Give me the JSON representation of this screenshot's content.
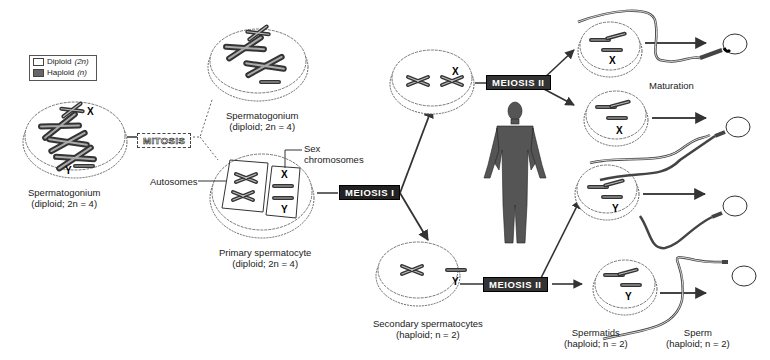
{
  "legend": {
    "items": [
      {
        "label": "Diploid",
        "notation": "(2n)",
        "swatch": "white"
      },
      {
        "label": "Haploid",
        "notation": "(n)",
        "swatch": "dark-gray"
      }
    ]
  },
  "processes": {
    "mitosis": "MITOSIS",
    "meiosis_1": "MEIOSIS I",
    "meiosis_2_top": "MEIOSIS II",
    "meiosis_2_bottom": "MEIOSIS II"
  },
  "cells": {
    "spermatogonium_left": {
      "name": "Spermatogonium",
      "ploidy": "(diploid; 2n = 4)",
      "chromosome_labels": [
        "X",
        "Y"
      ]
    },
    "spermatogonium_top": {
      "name": "Spermatogonium",
      "ploidy": "(diploid; 2n = 4)"
    },
    "primary_spermatocyte": {
      "name": "Primary spermatocyte",
      "ploidy": "(diploid; 2n = 4)",
      "chromosome_labels": [
        "X",
        "Y"
      ]
    },
    "secondary_spermatocyte_top": {
      "chromosome_labels": [
        "X"
      ]
    },
    "secondary_spermatocyte_bottom": {
      "chromosome_labels": [
        "Y"
      ]
    },
    "spermatid_1": {
      "chromosome_labels": [
        "X"
      ]
    },
    "spermatid_2": {
      "chromosome_labels": [
        "X"
      ]
    },
    "spermatid_3": {
      "chromosome_labels": [
        "Y"
      ]
    },
    "spermatid_4": {
      "chromosome_labels": [
        "Y"
      ]
    }
  },
  "labels": {
    "autosomes": "Autosomes",
    "sex_chromosomes_line1": "Sex",
    "sex_chromosomes_line2": "chromosomes",
    "secondary_name": "Secondary spermatocytes",
    "secondary_ploidy": "(haploid; n = 2)",
    "maturation": "Maturation",
    "spermatids_name": "Spermatids",
    "spermatids_ploidy": "(haploid; n = 2)",
    "sperm_name": "Sperm",
    "sperm_ploidy": "(haploid; n = 2)"
  }
}
